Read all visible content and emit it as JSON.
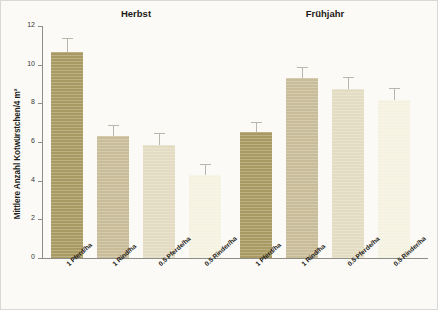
{
  "chart_data": {
    "type": "bar",
    "title": "",
    "xlabel": "",
    "ylabel": "Mittlere Anzahl Kotwürstchen/4 m²",
    "ylim": [
      0,
      12
    ],
    "yticks": [
      0,
      2,
      4,
      6,
      8,
      10,
      12
    ],
    "ytick_labels": [
      "0",
      "2",
      "4",
      "6",
      "8",
      "10",
      "12"
    ],
    "grid": false,
    "legend": "none",
    "categories": [
      "1 Pferd/ha",
      "1 Rind/ha",
      "0.5 Pferde/ha",
      "0.5 Rinder/ha"
    ],
    "groups": [
      {
        "name": "Herbst",
        "values": [
          10.65,
          6.3,
          5.85,
          4.3
        ],
        "errors": [
          0.75,
          0.6,
          0.6,
          0.55
        ]
      },
      {
        "name": "Frühjahr",
        "values": [
          6.5,
          9.3,
          8.75,
          8.15
        ],
        "errors": [
          0.55,
          0.6,
          0.6,
          0.65
        ]
      }
    ],
    "bar_colors": [
      "#a99a63",
      "#c9bc99",
      "#e3dcc2",
      "#f5f2e2"
    ],
    "error_bar_color": "#b7b7ae",
    "axis_color": "#8e8e88",
    "background_color": "#fbfaf6",
    "text_color": "#1d1a17"
  }
}
